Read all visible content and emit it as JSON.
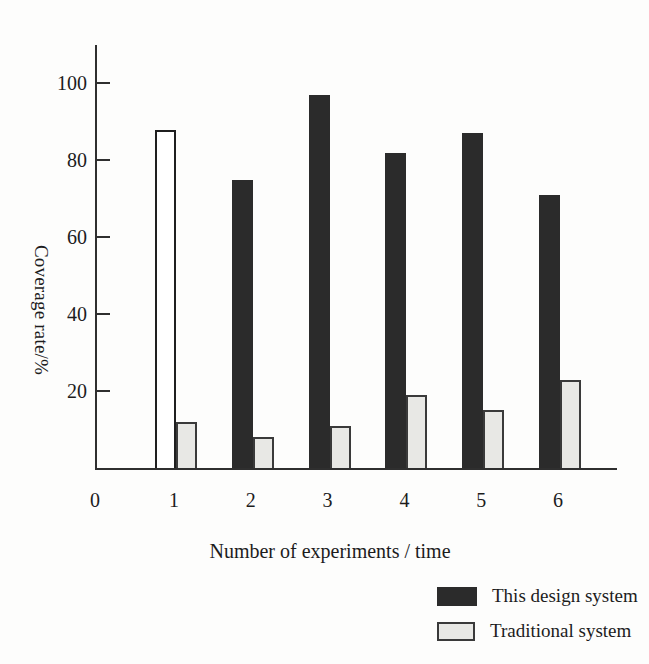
{
  "chart_data": {
    "type": "bar",
    "title": "",
    "xlabel": "Number of experiments / time",
    "ylabel": "Coverage rate/%",
    "categories": [
      1,
      2,
      3,
      4,
      5,
      6
    ],
    "x_tick_labels": [
      "0",
      "1",
      "2",
      "3",
      "4",
      "5",
      "6"
    ],
    "y_ticks": [
      20,
      40,
      60,
      80,
      100
    ],
    "ylim": [
      0,
      110
    ],
    "grid": false,
    "legend_position": "bottom-right",
    "series": [
      {
        "name": "This design system",
        "color": "#2b2b2b",
        "values": [
          88,
          75,
          97,
          82,
          87,
          71
        ],
        "bar_fills": [
          "#ffffff",
          "#2b2b2b",
          "#2b2b2b",
          "#2b2b2b",
          "#2b2b2b",
          "#2b2b2b"
        ]
      },
      {
        "name": "Traditional system",
        "color": "#e8e8e5",
        "border_color": "#3a3a3a",
        "values": [
          12,
          8,
          11,
          19,
          15,
          23
        ]
      }
    ]
  },
  "colors": {
    "axis": "#2f2f2f",
    "text": "#1c1c1c",
    "background": "#fdfdfc",
    "outline_bar_border": "#1f1f1f"
  }
}
